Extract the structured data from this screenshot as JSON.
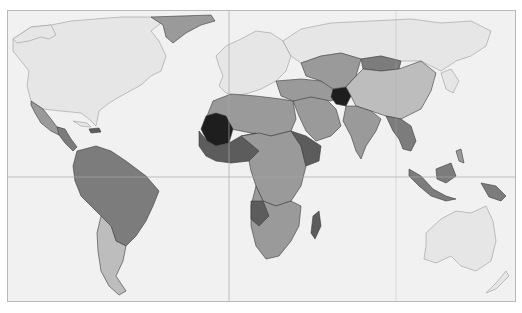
{
  "map": {
    "type": "choropleth world map",
    "color_scheme": "grayscale",
    "projection_grid": {
      "equator_y": 176,
      "meridian_x": [
        228,
        395
      ]
    },
    "palette": {
      "ocean": "#f1f1f1",
      "no_data": "#e6e6e6",
      "level_1": "#bdbdbd",
      "level_2": "#9a9a9a",
      "level_3": "#7c7c7c",
      "level_4": "#5c5c5c",
      "level_5": "#1e1e1e",
      "border": "#3a3a3a",
      "frame": "#b9b9b9"
    },
    "regions": [
      {
        "name": "Canada & USA",
        "shade": "no_data"
      },
      {
        "name": "Greenland",
        "shade": "level_2"
      },
      {
        "name": "Mexico",
        "shade": "level_2"
      },
      {
        "name": "Central America",
        "shade": "level_3"
      },
      {
        "name": "South America (north)",
        "shade": "level_3"
      },
      {
        "name": "Argentina / Chile",
        "shade": "level_1"
      },
      {
        "name": "Europe",
        "shade": "no_data"
      },
      {
        "name": "Russia",
        "shade": "no_data"
      },
      {
        "name": "North Africa",
        "shade": "level_2"
      },
      {
        "name": "Mali / Mauritania",
        "shade": "level_5"
      },
      {
        "name": "West Africa",
        "shade": "level_4"
      },
      {
        "name": "Central Africa",
        "shade": "level_2"
      },
      {
        "name": "Ethiopia / Horn",
        "shade": "level_4"
      },
      {
        "name": "Southern Africa",
        "shade": "level_2"
      },
      {
        "name": "Madagascar",
        "shade": "level_4"
      },
      {
        "name": "Middle East",
        "shade": "level_2"
      },
      {
        "name": "Afghanistan",
        "shade": "level_5"
      },
      {
        "name": "Central Asia",
        "shade": "level_2"
      },
      {
        "name": "India",
        "shade": "level_2"
      },
      {
        "name": "China",
        "shade": "level_1"
      },
      {
        "name": "Mongolia",
        "shade": "level_3"
      },
      {
        "name": "Southeast Asia",
        "shade": "level_3"
      },
      {
        "name": "Indonesia / PNG",
        "shade": "level_3"
      },
      {
        "name": "Australia / NZ",
        "shade": "no_data"
      }
    ]
  }
}
